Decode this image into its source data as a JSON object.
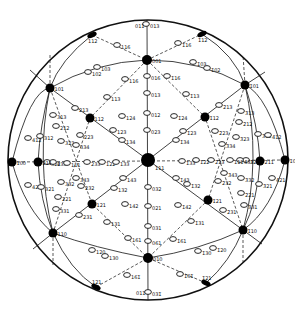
{
  "figure": {
    "center": [
      148,
      160
    ],
    "radius": 140
  },
  "major_poles": [
    {
      "label": "001",
      "x": 147,
      "y": 60
    },
    {
      "label": "111",
      "x": 148,
      "y": 160
    },
    {
      "label": "010",
      "x": 148,
      "y": 258
    },
    {
      "label": "101",
      "x": 50,
      "y": 88
    },
    {
      "label": "1̄01",
      "x": 245,
      "y": 85
    },
    {
      "label": "110",
      "x": 53,
      "y": 233
    },
    {
      "label": "1̄10",
      "x": 243,
      "y": 230
    },
    {
      "label": "112",
      "x": 90,
      "y": 118
    },
    {
      "label": "1̄12",
      "x": 205,
      "y": 117
    },
    {
      "label": "121",
      "x": 92,
      "y": 204
    },
    {
      "label": "1̄21",
      "x": 208,
      "y": 200
    },
    {
      "label": "211",
      "x": 38,
      "y": 162
    },
    {
      "label": "2̄11",
      "x": 260,
      "y": 161
    },
    {
      "label": "100",
      "x": 12,
      "y": 162
    },
    {
      "label": "1̄00",
      "x": 285,
      "y": 160
    }
  ],
  "rim_poles": [
    {
      "label": "112",
      "x": 92,
      "y": 35
    },
    {
      "label": "1̄12",
      "x": 202,
      "y": 34
    },
    {
      "label": "121",
      "x": 96,
      "y": 287
    },
    {
      "label": "1̄21",
      "x": 206,
      "y": 283
    },
    {
      "label": "011",
      "x": 147,
      "y": 20
    },
    {
      "label": "011",
      "x": 148,
      "y": 298
    }
  ],
  "minor_poles": [
    {
      "label": "013",
      "x": 146,
      "y": 24
    },
    {
      "label": "116",
      "x": 117,
      "y": 45
    },
    {
      "label": "1̄16",
      "x": 178,
      "y": 43
    },
    {
      "label": "103",
      "x": 97,
      "y": 67
    },
    {
      "label": "102",
      "x": 88,
      "y": 72
    },
    {
      "label": "1̄03",
      "x": 193,
      "y": 62
    },
    {
      "label": "1̄02",
      "x": 207,
      "y": 68
    },
    {
      "label": "016",
      "x": 147,
      "y": 76
    },
    {
      "label": "116",
      "x": 125,
      "y": 79
    },
    {
      "label": "1̄16",
      "x": 167,
      "y": 76
    },
    {
      "label": "013",
      "x": 147,
      "y": 93
    },
    {
      "label": "113",
      "x": 107,
      "y": 97
    },
    {
      "label": "1̄13",
      "x": 186,
      "y": 94
    },
    {
      "label": "012",
      "x": 147,
      "y": 113
    },
    {
      "label": "124",
      "x": 122,
      "y": 116
    },
    {
      "label": "1̄24",
      "x": 174,
      "y": 116
    },
    {
      "label": "023",
      "x": 147,
      "y": 130
    },
    {
      "label": "123",
      "x": 113,
      "y": 130
    },
    {
      "label": "1̄23",
      "x": 183,
      "y": 131
    },
    {
      "label": "134",
      "x": 122,
      "y": 140
    },
    {
      "label": "1̄34",
      "x": 176,
      "y": 140
    },
    {
      "label": "213",
      "x": 75,
      "y": 108
    },
    {
      "label": "2̄13",
      "x": 219,
      "y": 105
    },
    {
      "label": "313",
      "x": 53,
      "y": 115
    },
    {
      "label": "3̄13",
      "x": 241,
      "y": 111
    },
    {
      "label": "212",
      "x": 56,
      "y": 126
    },
    {
      "label": "2̄12",
      "x": 239,
      "y": 122
    },
    {
      "label": "312",
      "x": 40,
      "y": 136
    },
    {
      "label": "3̄12",
      "x": 258,
      "y": 134
    },
    {
      "label": "412",
      "x": 28,
      "y": 138
    },
    {
      "label": "4̄12",
      "x": 268,
      "y": 135
    },
    {
      "label": "323",
      "x": 61,
      "y": 141
    },
    {
      "label": "3̄23",
      "x": 236,
      "y": 137
    },
    {
      "label": "223",
      "x": 80,
      "y": 135
    },
    {
      "label": "2̄23",
      "x": 215,
      "y": 131
    },
    {
      "label": "334",
      "x": 76,
      "y": 145
    },
    {
      "label": "3̄34",
      "x": 222,
      "y": 144
    },
    {
      "label": "322",
      "x": 47,
      "y": 162
    },
    {
      "label": "3̄22",
      "x": 246,
      "y": 160
    },
    {
      "label": "433",
      "x": 53,
      "y": 162
    },
    {
      "label": "4̄33",
      "x": 240,
      "y": 160
    },
    {
      "label": "111",
      "x": 67,
      "y": 163
    },
    {
      "label": "1̄11",
      "x": 230,
      "y": 160
    },
    {
      "label": "233",
      "x": 87,
      "y": 162
    },
    {
      "label": "2̄33",
      "x": 211,
      "y": 160
    },
    {
      "label": "122",
      "x": 102,
      "y": 162
    },
    {
      "label": "1̄22",
      "x": 196,
      "y": 160
    },
    {
      "label": "133",
      "x": 116,
      "y": 162
    },
    {
      "label": "1̄33",
      "x": 182,
      "y": 161
    },
    {
      "label": "343",
      "x": 76,
      "y": 178
    },
    {
      "label": "3̄43",
      "x": 224,
      "y": 173
    },
    {
      "label": "332",
      "x": 61,
      "y": 182
    },
    {
      "label": "3̄32",
      "x": 241,
      "y": 178
    },
    {
      "label": "232",
      "x": 81,
      "y": 186
    },
    {
      "label": "2̄32",
      "x": 218,
      "y": 181
    },
    {
      "label": "143",
      "x": 123,
      "y": 178
    },
    {
      "label": "1̄43",
      "x": 176,
      "y": 178
    },
    {
      "label": "132",
      "x": 114,
      "y": 188
    },
    {
      "label": "1̄32",
      "x": 187,
      "y": 184
    },
    {
      "label": "421",
      "x": 28,
      "y": 185
    },
    {
      "label": "4̄21",
      "x": 272,
      "y": 178
    },
    {
      "label": "321",
      "x": 41,
      "y": 187
    },
    {
      "label": "3̄21",
      "x": 259,
      "y": 184
    },
    {
      "label": "221",
      "x": 58,
      "y": 197
    },
    {
      "label": "2̄21",
      "x": 241,
      "y": 193
    },
    {
      "label": "331",
      "x": 56,
      "y": 209
    },
    {
      "label": "3̄31",
      "x": 244,
      "y": 205
    },
    {
      "label": "231",
      "x": 79,
      "y": 215
    },
    {
      "label": "2̄31",
      "x": 223,
      "y": 210
    },
    {
      "label": "142",
      "x": 125,
      "y": 204
    },
    {
      "label": "1̄42",
      "x": 178,
      "y": 205
    },
    {
      "label": "032",
      "x": 148,
      "y": 187
    },
    {
      "label": "021",
      "x": 148,
      "y": 206
    },
    {
      "label": "131",
      "x": 107,
      "y": 222
    },
    {
      "label": "1̄31",
      "x": 191,
      "y": 221
    },
    {
      "label": "031",
      "x": 148,
      "y": 226
    },
    {
      "label": "161",
      "x": 128,
      "y": 238
    },
    {
      "label": "1̄61",
      "x": 173,
      "y": 239
    },
    {
      "label": "061",
      "x": 148,
      "y": 241
    },
    {
      "label": "120",
      "x": 92,
      "y": 250
    },
    {
      "label": "130",
      "x": 105,
      "y": 256
    },
    {
      "label": "1̄20",
      "x": 213,
      "y": 248
    },
    {
      "label": "1̄30",
      "x": 198,
      "y": 251
    },
    {
      "label": "161̄",
      "x": 127,
      "y": 275
    },
    {
      "label": "1̄61̄",
      "x": 180,
      "y": 274
    },
    {
      "label": "031̄",
      "x": 148,
      "y": 292
    }
  ]
}
